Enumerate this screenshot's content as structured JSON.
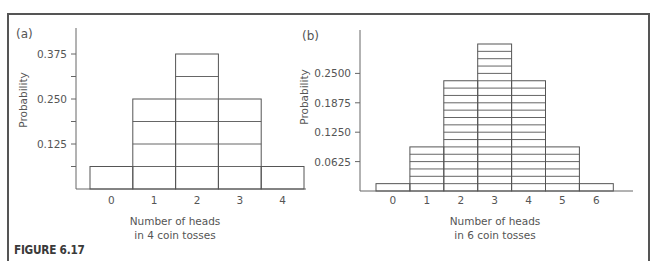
{
  "figure": {
    "caption": "FIGURE 6.17"
  },
  "chart_data": [
    {
      "type": "bar",
      "panel_label": "(a)",
      "title": "",
      "xlabel": [
        "Number of heads",
        "in 4 coin tosses"
      ],
      "ylabel": "Probability",
      "categories": [
        "0",
        "1",
        "2",
        "3",
        "4"
      ],
      "values": [
        0.0625,
        0.25,
        0.375,
        0.25,
        0.0625
      ],
      "counts": [
        1,
        4,
        6,
        4,
        1
      ],
      "unit": 0.0625,
      "yticks": [
        0.0625,
        0.125,
        0.1875,
        0.25,
        0.3125,
        0.375
      ],
      "ytick_labels": [
        "",
        "0.125",
        "",
        "0.250",
        "",
        "0.375"
      ],
      "ylim": [
        0,
        0.42
      ],
      "bar_style": "histogram with horizontal division lines at each 1/16 unit",
      "grid": false,
      "legend": null
    },
    {
      "type": "bar",
      "panel_label": "(b)",
      "title": "",
      "xlabel": [
        "Number of heads",
        "in 6 coin tosses"
      ],
      "ylabel": "Probability",
      "categories": [
        "0",
        "1",
        "2",
        "3",
        "4",
        "5",
        "6"
      ],
      "values": [
        0.015625,
        0.09375,
        0.234375,
        0.3125,
        0.234375,
        0.09375,
        0.015625
      ],
      "counts": [
        1,
        6,
        15,
        20,
        15,
        6,
        1
      ],
      "unit": 0.015625,
      "yticks": [
        0.0625,
        0.125,
        0.1875,
        0.25
      ],
      "ytick_labels": [
        "0.0625",
        "0.1250",
        "0.1875",
        "0.2500"
      ],
      "ylim": [
        0,
        0.36
      ],
      "bar_style": "histogram with horizontal division lines at each 1/64 unit",
      "grid": false,
      "legend": null
    }
  ]
}
